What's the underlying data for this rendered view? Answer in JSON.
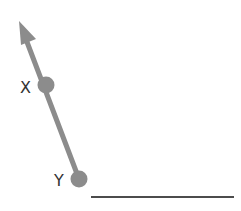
{
  "diagram": {
    "colors": {
      "ray": "#8c8c8c",
      "baseline": "#111111",
      "label": "#333333",
      "background": "#ffffff"
    },
    "points": [
      {
        "id": "X",
        "label": "X"
      },
      {
        "id": "Y",
        "label": "Y"
      }
    ],
    "ray": {
      "from": "Y",
      "through": "X",
      "direction": "up-left",
      "arrowhead": true
    },
    "baseline": {
      "description": "horizontal line segment"
    }
  }
}
